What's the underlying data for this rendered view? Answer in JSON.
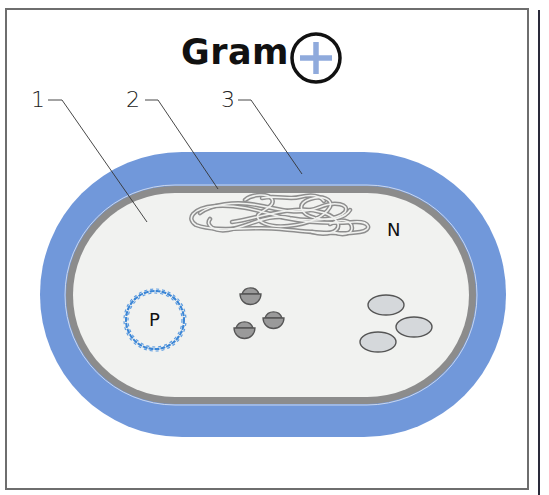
{
  "title": {
    "text": "Gram",
    "symbol": "+",
    "symbol_name": "plus-in-circle"
  },
  "labels": [
    {
      "id": "1",
      "text": "1",
      "target": "cytoplasm"
    },
    {
      "id": "2",
      "text": "2",
      "target": "cytoplasmic-membrane"
    },
    {
      "id": "3",
      "text": "3",
      "target": "cell-wall"
    }
  ],
  "inner_labels": {
    "nucleoid": "N",
    "plasmid": "P"
  },
  "colors": {
    "cell_wall": "#7198da",
    "membrane": "#8c8c8c",
    "cytoplasm": "#f1f2f0",
    "plasmid": "#3b86d6",
    "ribosome": "#9a9a9a",
    "inclusion": "#d5d8db",
    "plus_sign": "#8faadc",
    "frame": "#6e6e6e"
  },
  "components": {
    "ribosome_count": 3,
    "inclusion_count": 3
  }
}
